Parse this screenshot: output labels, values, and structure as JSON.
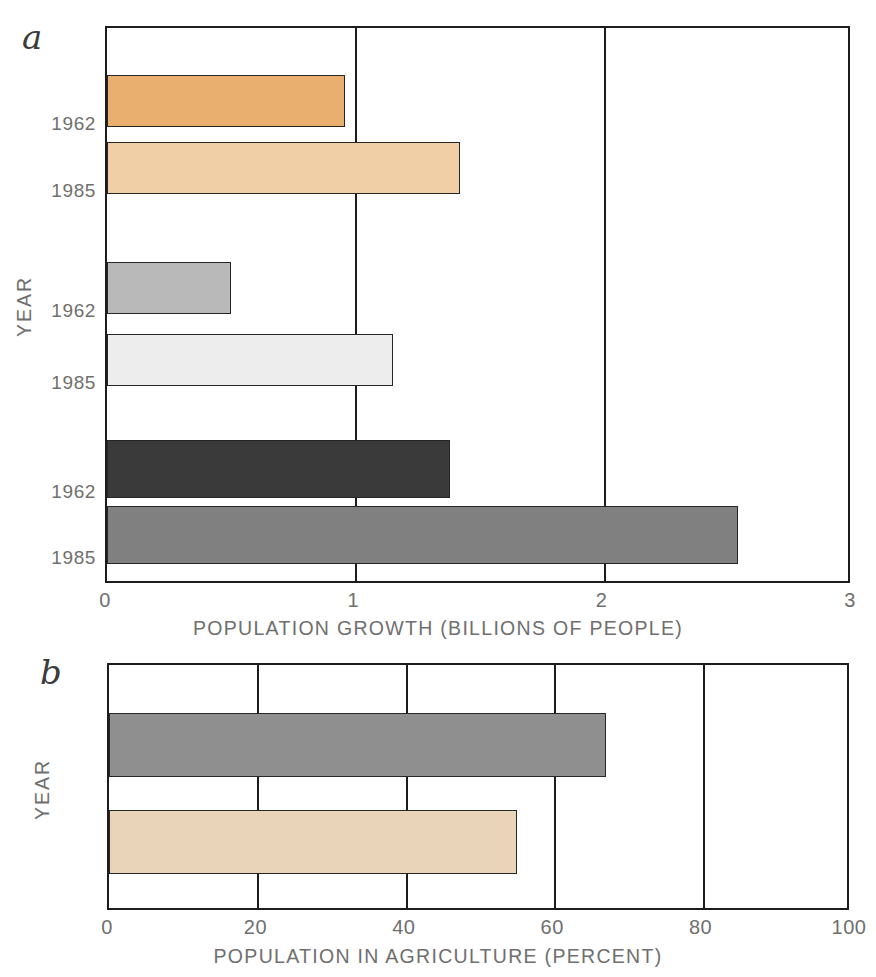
{
  "figure": {
    "panels": [
      {
        "letter": "a",
        "y_axis_title": "YEAR",
        "x_axis_title": "POPULATION GROWTH (BILLIONS OF PEOPLE)",
        "x_ticks": [
          "0",
          "1",
          "2",
          "3"
        ]
      },
      {
        "letter": "b",
        "y_axis_title": "YEAR",
        "x_axis_title": "POPULATION IN AGRICULTURE (PERCENT)",
        "x_ticks": [
          "0",
          "20",
          "40",
          "60",
          "80",
          "100"
        ]
      }
    ]
  },
  "chart_data": [
    {
      "type": "bar",
      "orientation": "horizontal",
      "panel": "a",
      "title": "",
      "xlabel": "POPULATION GROWTH (BILLIONS OF PEOPLE)",
      "ylabel": "YEAR",
      "xlim": [
        0,
        3
      ],
      "xticks": [
        0,
        1,
        2,
        3
      ],
      "grid": true,
      "legend": "none",
      "categories": [
        "1962",
        "1985",
        "1962",
        "1985",
        "1962",
        "1985"
      ],
      "values": [
        0.96,
        1.42,
        0.5,
        1.15,
        1.38,
        2.54
      ],
      "bars": [
        {
          "label": "1962",
          "value": 0.96,
          "color": "#e8af6e"
        },
        {
          "label": "1985",
          "value": 1.42,
          "color": "#f0cfa6"
        },
        {
          "label": "1962",
          "value": 0.5,
          "color": "#b9b9b9"
        },
        {
          "label": "1985",
          "value": 1.15,
          "color": "#ededed"
        },
        {
          "label": "1962",
          "value": 1.38,
          "color": "#3a3a3a"
        },
        {
          "label": "1985",
          "value": 2.54,
          "color": "#808080"
        }
      ]
    },
    {
      "type": "bar",
      "orientation": "horizontal",
      "panel": "b",
      "title": "",
      "xlabel": "POPULATION IN AGRICULTURE (PERCENT)",
      "ylabel": "YEAR",
      "xlim": [
        0,
        100
      ],
      "xticks": [
        0,
        20,
        40,
        60,
        80,
        100
      ],
      "grid": true,
      "legend": "none",
      "categories": [
        "1962",
        "1985"
      ],
      "values": [
        67,
        55
      ],
      "bars": [
        {
          "label": "1962",
          "value": 67,
          "color": "#8f8f8f"
        },
        {
          "label": "1985",
          "value": 55,
          "color": "#e9d4ba"
        }
      ]
    }
  ]
}
